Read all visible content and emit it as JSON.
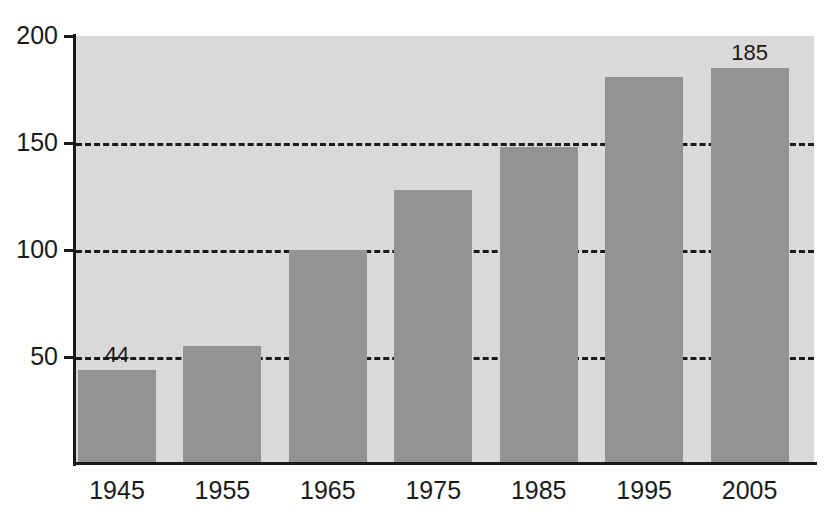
{
  "chart_data": {
    "type": "bar",
    "title": "",
    "subtitle": "",
    "xlabel": "",
    "ylabel": "",
    "categories": [
      "1945",
      "1955",
      "1965",
      "1975",
      "1985",
      "1995",
      "2005"
    ],
    "values": [
      44,
      55,
      100,
      128,
      148,
      181,
      185
    ],
    "value_labels": [
      "44",
      "",
      "",
      "",
      "",
      "",
      "185"
    ],
    "ylim": [
      0,
      200
    ],
    "yticks": [
      50,
      100,
      150,
      200
    ],
    "ytick_labels": [
      "50",
      "100",
      "150",
      "200"
    ],
    "grid": "horizontal-dashed",
    "gridlines": [
      50,
      100,
      150
    ],
    "legend": "none",
    "series": [
      {
        "name": "",
        "values": [
          44,
          55,
          100,
          128,
          148,
          181,
          185
        ]
      }
    ],
    "colors": {
      "bar_fill": "#939393",
      "plot_background": "#d9d9d9",
      "axis": "#1a1a1a",
      "gridline": "#1a1a1a",
      "page_background": "#ffffff",
      "text": "#1a1a1a"
    }
  }
}
